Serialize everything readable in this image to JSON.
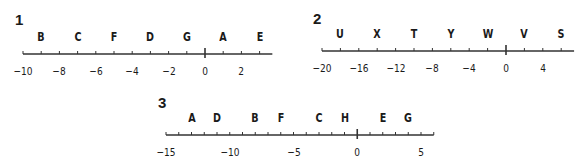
{
  "number_lines": [
    {
      "label": "1",
      "label_pos": [
        15,
        12
      ],
      "line_y": 54,
      "min": -10,
      "max": 3.7,
      "tick_step": 1,
      "x_at_min": 23,
      "px_per_unit": 18.2,
      "tick_labels": [
        {
          "value": -10,
          "text": "−10"
        },
        {
          "value": -8,
          "text": "−8"
        },
        {
          "value": -6,
          "text": "−6"
        },
        {
          "value": -4,
          "text": "−4"
        },
        {
          "value": -2,
          "text": "−2"
        },
        {
          "value": 0,
          "text": "0"
        },
        {
          "value": 2,
          "text": "2"
        }
      ],
      "points": [
        {
          "letter": "B",
          "value": -9
        },
        {
          "letter": "C",
          "value": -7
        },
        {
          "letter": "F",
          "value": -5
        },
        {
          "letter": "D",
          "value": -3
        },
        {
          "letter": "G",
          "value": -1
        },
        {
          "letter": "A",
          "value": 1
        },
        {
          "letter": "E",
          "value": 3
        }
      ]
    },
    {
      "label": "2",
      "label_pos": [
        313,
        11
      ],
      "line_y": 51,
      "min": -20,
      "max": 7.4,
      "tick_step": 2,
      "x_at_min": 322,
      "px_per_unit": 9.2,
      "tick_labels": [
        {
          "value": -20,
          "text": "−20"
        },
        {
          "value": -16,
          "text": "−16"
        },
        {
          "value": -12,
          "text": "−12"
        },
        {
          "value": -8,
          "text": "−8"
        },
        {
          "value": -4,
          "text": "−4"
        },
        {
          "value": 0,
          "text": "0"
        },
        {
          "value": 4,
          "text": "4"
        }
      ],
      "points": [
        {
          "letter": "U",
          "value": -18
        },
        {
          "letter": "X",
          "value": -14
        },
        {
          "letter": "T",
          "value": -10
        },
        {
          "letter": "Y",
          "value": -6
        },
        {
          "letter": "W",
          "value": -2
        },
        {
          "letter": "V",
          "value": 2
        },
        {
          "letter": "S",
          "value": 6
        }
      ]
    },
    {
      "label": "3",
      "label_pos": [
        158,
        95
      ],
      "line_y": 135,
      "min": -15,
      "max": 6,
      "tick_step": 1,
      "x_at_min": 166,
      "px_per_unit": 12.75,
      "tick_labels": [
        {
          "value": -15,
          "text": "−15"
        },
        {
          "value": -10,
          "text": "−10"
        },
        {
          "value": -5,
          "text": "−5"
        },
        {
          "value": 0,
          "text": "0"
        },
        {
          "value": 5,
          "text": "5"
        }
      ],
      "points": [
        {
          "letter": "A",
          "value": -13
        },
        {
          "letter": "D",
          "value": -11
        },
        {
          "letter": "B",
          "value": -8
        },
        {
          "letter": "F",
          "value": -6
        },
        {
          "letter": "C",
          "value": -3
        },
        {
          "letter": "H",
          "value": -1
        },
        {
          "letter": "E",
          "value": 2
        },
        {
          "letter": "G",
          "value": 4
        }
      ]
    }
  ]
}
